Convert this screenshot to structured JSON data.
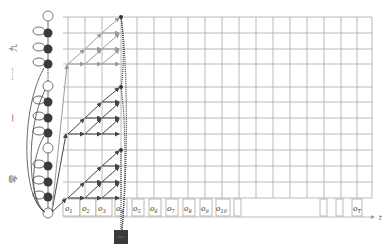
{
  "diagram": {
    "title": "",
    "side_labels": [
      {
        "text": "九",
        "y": 46
      },
      {
        "text": "......",
        "y": 75
      },
      {
        "text": "一",
        "y": 117
      },
      {
        "text": "零",
        "y": 178
      }
    ],
    "observations": [
      {
        "label": "o",
        "sub": "1"
      },
      {
        "label": "o",
        "sub": "2"
      },
      {
        "label": "o",
        "sub": "3"
      },
      {
        "label": "o",
        "sub": "4"
      },
      {
        "label": "o",
        "sub": "5"
      },
      {
        "label": "o",
        "sub": "6"
      },
      {
        "label": "o",
        "sub": "7"
      },
      {
        "label": "o",
        "sub": "8"
      },
      {
        "label": "o",
        "sub": "9"
      },
      {
        "label": "o",
        "sub": "10"
      },
      {
        "label": "o",
        "sub": "T"
      }
    ],
    "axis_label": "t",
    "colors": {
      "grid": "#a8a8a8",
      "node_dark": "#3a3a3a",
      "arrow_dark": "#444444",
      "arrow_light": "#9a9a9a",
      "output_box": "#3a3a3a"
    }
  }
}
